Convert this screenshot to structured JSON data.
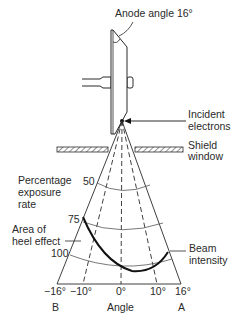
{
  "diagram": {
    "labels": {
      "anode_angle": "Anode angle 16°",
      "incident_line1": "Incident",
      "incident_line2": "electrons",
      "shield_line1": "Shield",
      "shield_line2": "window",
      "percentage_line1": "Percentage",
      "percentage_line2": "exposure",
      "percentage_line3": "rate",
      "heel_line1": "Area of",
      "heel_line2": "heel effect",
      "beam_line1": "Beam",
      "beam_line2": "intensity",
      "axis_title": "Angle",
      "side_left": "B",
      "side_right": "A"
    },
    "isodose_values": [
      "50",
      "75",
      "100"
    ],
    "angle_ticks": [
      "−16°",
      "−10°",
      "0°",
      "10°",
      "16°"
    ],
    "colors": {
      "line": "#2a2a2a",
      "curve": "#111111",
      "background": "#ffffff"
    }
  }
}
